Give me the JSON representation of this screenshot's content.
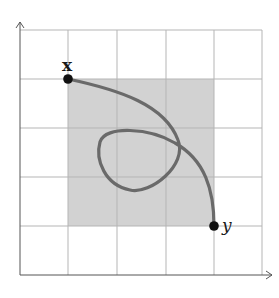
{
  "diagram": {
    "type": "path-in-square-on-grid",
    "grid": {
      "columns": 5,
      "rows": 5,
      "line_color": "#b5b5b5"
    },
    "shaded_region": {
      "color": "#d2d2d2",
      "from_cell": [
        1,
        1
      ],
      "to_cell": [
        4,
        4
      ]
    },
    "curve": {
      "color": "#6a6a6a",
      "description": "path from x to y with a self-intersecting loop"
    },
    "points": [
      {
        "label": "x",
        "position": "top-left corner of shaded square"
      },
      {
        "label": "y",
        "position": "bottom-right corner of shaded square"
      }
    ],
    "axes": {
      "x_arrow": true,
      "y_arrow": true,
      "color": "#555555"
    }
  },
  "labels": {
    "start": "x",
    "end": "y"
  }
}
